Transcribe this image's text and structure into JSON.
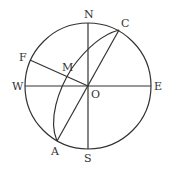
{
  "diagram": {
    "type": "celestial-sphere-projection",
    "circle": {
      "cx": 88,
      "cy": 86,
      "r": 63
    },
    "stroke_color": "#333333",
    "labels": {
      "N": "N",
      "S": "S",
      "E": "E",
      "W": "W",
      "O": "O",
      "C": "C",
      "A": "A",
      "F": "F",
      "M": "M"
    },
    "points": {
      "N": [
        88,
        23
      ],
      "S": [
        88,
        149
      ],
      "E": [
        151,
        86
      ],
      "W": [
        25,
        86
      ],
      "O": [
        88,
        86
      ],
      "C": [
        119,
        30
      ],
      "A": [
        57,
        141
      ],
      "F": [
        30,
        60
      ],
      "M": [
        71,
        79
      ]
    },
    "segments": [
      [
        "N",
        "S"
      ],
      [
        "W",
        "E"
      ],
      [
        "C",
        "A"
      ],
      [
        "F",
        "O"
      ]
    ],
    "arc": {
      "from": "A",
      "to": "C",
      "through": [
        66,
        86
      ]
    }
  }
}
